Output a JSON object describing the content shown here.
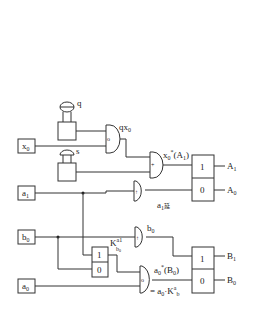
{
  "diagram": {
    "inputs": {
      "x0": {
        "label": "x",
        "sub": "0"
      },
      "a1": {
        "label": "a",
        "sub": "1"
      },
      "b0": {
        "label": "b",
        "sub": "0"
      },
      "a0": {
        "label": "a",
        "sub": "0"
      }
    },
    "buttons": {
      "q": "q",
      "s": "s"
    },
    "gates": {
      "and_qx0": {
        "symbol": "o",
        "output_label": "qx",
        "output_sub": "0"
      },
      "or_x0": {
        "symbol": "+",
        "output_label": "x",
        "output_sub": "0",
        "output_sup": "*",
        "output_suffix": "(A",
        "output_suffix_sub": "1",
        "output_close": ")"
      },
      "a1_delay": {
        "symbol": "↑",
        "output_label": "a",
        "output_sub": "1",
        "output_suffix": "延"
      },
      "b0_delay": {
        "symbol": "↑",
        "output_label": "b",
        "output_sub": "0"
      },
      "and_a0": {
        "symbol": "o",
        "output_label": "a",
        "output_sub": "0",
        "output_sup": "*",
        "output_suffix": "(B",
        "output_suffix_sub": "0",
        "output_close": ")",
        "eq_prefix": "= a",
        "eq_sub": "0",
        "eq_mid": "·K",
        "eq_k_sup": "a",
        "eq_k_sup_sub": "1",
        "eq_k_sub": "b",
        "eq_k_sub_sub": "0"
      }
    },
    "selector_k": {
      "top": "1",
      "bottom": "0",
      "label": "K",
      "label_sup": "a",
      "label_sup_sub": "1",
      "label_sub": "b",
      "label_sub_sub": "0"
    },
    "register_A": {
      "top": "1",
      "bottom": "0",
      "out_top": {
        "label": "A",
        "sub": "1"
      },
      "out_bottom": {
        "label": "A",
        "sub": "0"
      }
    },
    "register_B": {
      "top": "1",
      "bottom": "0",
      "out_top": {
        "label": "B",
        "sub": "1"
      },
      "out_bottom": {
        "label": "B",
        "sub": "0"
      }
    }
  }
}
